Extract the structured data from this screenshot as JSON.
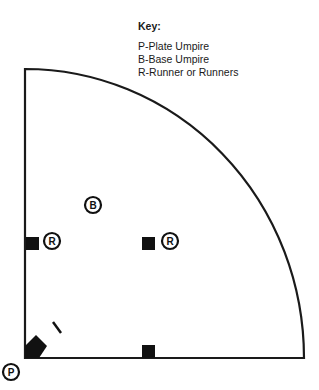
{
  "key": {
    "title": "Key:",
    "items": [
      "P-Plate Umpire",
      "B-Base Umpire",
      "R-Runner or Runners"
    ]
  },
  "diagram": {
    "line_color": "#1a1a1a",
    "markers": {
      "plate_umpire": "P",
      "base_umpire": "B",
      "runner_first": "R",
      "runner_second": "R"
    }
  }
}
